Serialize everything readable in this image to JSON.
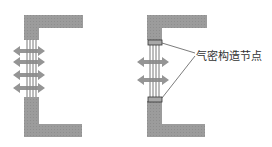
{
  "diagram": {
    "left_panel": {
      "description": "wall opening without airtight seals, air leaking through",
      "arrow_count": 4
    },
    "right_panel": {
      "description": "wall opening with airtight sealing nodes",
      "arrow_count": 2,
      "callout_label": "气密构造节点"
    },
    "colors": {
      "wall": "#9a9a9a",
      "arrow": "#8a8a8a",
      "window_line": "#555555",
      "seal": "#a8a8a8",
      "text": "#333333"
    }
  }
}
